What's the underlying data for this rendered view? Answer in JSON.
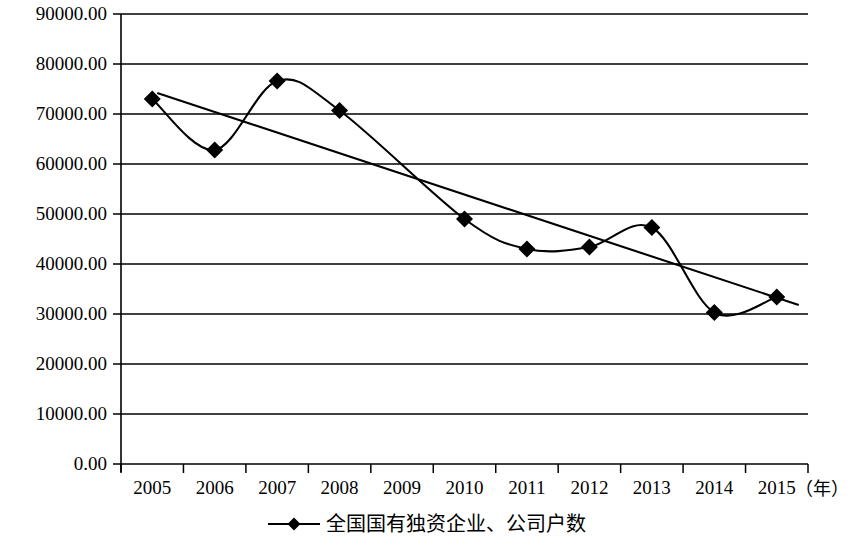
{
  "chart_data": {
    "type": "line",
    "title": "",
    "subtitle": "",
    "xlabel": "年",
    "ylabel": "",
    "categories": [
      "2005",
      "2006",
      "2007",
      "2008",
      "2009",
      "2010",
      "2011",
      "2012",
      "2013",
      "2014",
      "2015"
    ],
    "x_unit_label": "（年）",
    "ylim": [
      0,
      90000
    ],
    "y_ticks": [
      0,
      10000,
      20000,
      30000,
      40000,
      50000,
      60000,
      70000,
      80000,
      90000
    ],
    "y_tick_labels": [
      "0.00",
      "10000.00",
      "20000.00",
      "30000.00",
      "40000.00",
      "50000.00",
      "60000.00",
      "70000.00",
      "80000.00",
      "90000.00"
    ],
    "grid": true,
    "grid_axis": "y",
    "legend_position": "bottom",
    "smoothing": "spline",
    "marker": "diamond",
    "series": [
      {
        "name": "全国国有独资企业、公司户数",
        "values": [
          73000,
          62800,
          76600,
          70700,
          null,
          49000,
          43000,
          43400,
          47300,
          30300,
          33400
        ],
        "color": "#000000"
      }
    ],
    "trendline": {
      "type": "linear",
      "visible": true,
      "start": {
        "x": "2005",
        "y": 74200
      },
      "end": {
        "x": "2015",
        "y": 31800
      },
      "color": "#000000"
    },
    "annotations": []
  },
  "legend": {
    "entries": [
      {
        "label": "全国国有独资企业、公司户数",
        "marker": "diamond-line-marker",
        "color": "#000000"
      }
    ]
  },
  "axes": {
    "y_axis_label": "",
    "x_axis_label": "（年）"
  },
  "colors": {
    "series": "#000000",
    "grid": "#000000",
    "axis": "#000000",
    "background": "#ffffff"
  }
}
